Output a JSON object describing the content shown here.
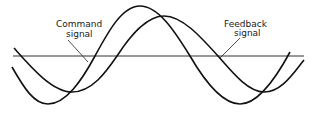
{
  "diagram": {
    "type": "waveform-comparison",
    "axis": {
      "y": 56,
      "x_start": 13,
      "x_end": 304
    },
    "labels": [
      {
        "id": "command",
        "lines": [
          "Command",
          "signal"
        ]
      },
      {
        "id": "feedback",
        "lines": [
          "Feedback",
          "signal"
        ]
      }
    ],
    "series": [
      {
        "name": "Command signal",
        "role": "leading sine wave"
      },
      {
        "name": "Feedback signal",
        "role": "lagging sine wave"
      }
    ],
    "colors": {
      "line": "#111111",
      "axis": "#333333",
      "background": "#ffffff"
    }
  }
}
